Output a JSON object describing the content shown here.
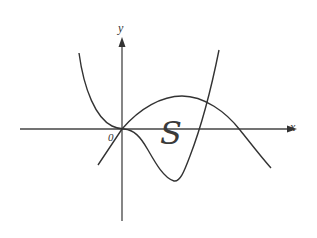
{
  "diagram": {
    "type": "function-graph",
    "axes": {
      "x_label": "x",
      "y_label": "y",
      "origin_label": "0"
    },
    "region_label": "S",
    "curves": [
      {
        "name": "curve-quartic",
        "description": "flat at origin, dips below x-axis to a minimum, then rises steeply crossing the other curve"
      },
      {
        "name": "curve-parabola",
        "description": "downward-opening curve through origin, peaks above x-axis, crosses x-axis on the right and descends"
      }
    ],
    "colors": {
      "stroke": "#333333",
      "axis": "#444444",
      "background": "#ffffff"
    }
  }
}
